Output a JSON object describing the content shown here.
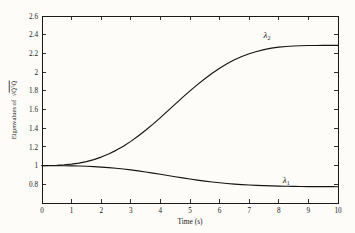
{
  "chart_data": {
    "type": "line",
    "title": "",
    "xlabel": "Time (s)",
    "ylabel": "Eigenvalues of √(Q̃ᵀQ̃)",
    "ylabel_parts": {
      "prefix": "Eigenvalues of",
      "radicand": "Q̃ᵀQ̃"
    },
    "xlim": [
      0,
      10
    ],
    "ylim": [
      0.6,
      2.6
    ],
    "grid": false,
    "legend_position": "inline-annotation",
    "xticks": [
      "0",
      "1",
      "2",
      "3",
      "4",
      "5",
      "6",
      "7",
      "8",
      "9",
      "10"
    ],
    "xtick_values": [
      0,
      1,
      2,
      3,
      4,
      5,
      6,
      7,
      8,
      9,
      10
    ],
    "yticks": [
      "0.8",
      "1",
      "1.2",
      "1.4",
      "1.6",
      "1.8",
      "2",
      "2.2",
      "2.4",
      "2.6"
    ],
    "ytick_values": [
      0.8,
      1,
      1.2,
      1.4,
      1.6,
      1.8,
      2,
      2.2,
      2.4,
      2.6
    ],
    "series": [
      {
        "name": "λ2",
        "label": "λ",
        "subscript": "2",
        "color": "#141414",
        "annotation_x": 7.6,
        "annotation_y": 2.37,
        "x": [
          0,
          0.25,
          0.5,
          0.75,
          1,
          1.25,
          1.5,
          1.75,
          2,
          2.25,
          2.5,
          2.75,
          3,
          3.25,
          3.5,
          3.75,
          4,
          4.25,
          4.5,
          4.75,
          5,
          5.25,
          5.5,
          5.75,
          6,
          6.25,
          6.5,
          6.75,
          7,
          7.25,
          7.5,
          7.75,
          8,
          8.25,
          8.5,
          8.75,
          9,
          9.25,
          9.5,
          9.75,
          10
        ],
        "values": [
          1.0,
          1.001,
          1.004,
          1.009,
          1.016,
          1.027,
          1.043,
          1.064,
          1.091,
          1.124,
          1.163,
          1.208,
          1.259,
          1.316,
          1.378,
          1.444,
          1.513,
          1.585,
          1.657,
          1.729,
          1.799,
          1.866,
          1.929,
          1.988,
          2.041,
          2.089,
          2.131,
          2.167,
          2.197,
          2.221,
          2.241,
          2.256,
          2.267,
          2.274,
          2.279,
          2.282,
          2.284,
          2.285,
          2.286,
          2.286,
          2.286
        ]
      },
      {
        "name": "λ1",
        "label": "λ",
        "subscript": "1",
        "color": "#141414",
        "annotation_x": 8.25,
        "annotation_y": 0.815,
        "x": [
          0,
          0.25,
          0.5,
          0.75,
          1,
          1.25,
          1.5,
          1.75,
          2,
          2.25,
          2.5,
          2.75,
          3,
          3.25,
          3.5,
          3.75,
          4,
          4.25,
          4.5,
          4.75,
          5,
          5.25,
          5.5,
          5.75,
          6,
          6.25,
          6.5,
          6.75,
          7,
          7.25,
          7.5,
          7.75,
          8,
          8.25,
          8.5,
          8.75,
          9,
          9.25,
          9.5,
          9.75,
          10
        ],
        "values": [
          1.0,
          0.9998,
          0.9993,
          0.9985,
          0.9972,
          0.9952,
          0.9925,
          0.9888,
          0.9841,
          0.9783,
          0.9713,
          0.9631,
          0.9538,
          0.9434,
          0.9321,
          0.92,
          0.9073,
          0.8943,
          0.8813,
          0.8685,
          0.8562,
          0.8447,
          0.8341,
          0.8246,
          0.8161,
          0.8087,
          0.8023,
          0.7968,
          0.7922,
          0.7884,
          0.7852,
          0.7826,
          0.7805,
          0.7788,
          0.7775,
          0.7765,
          0.7757,
          0.7751,
          0.7747,
          0.7744,
          0.7742
        ]
      }
    ]
  },
  "figure": {
    "background_color": "#fdfcf8",
    "axis_color": "#1a1a1a",
    "plot_left": 42,
    "plot_right": 338,
    "plot_top": 16,
    "plot_bottom": 203
  }
}
